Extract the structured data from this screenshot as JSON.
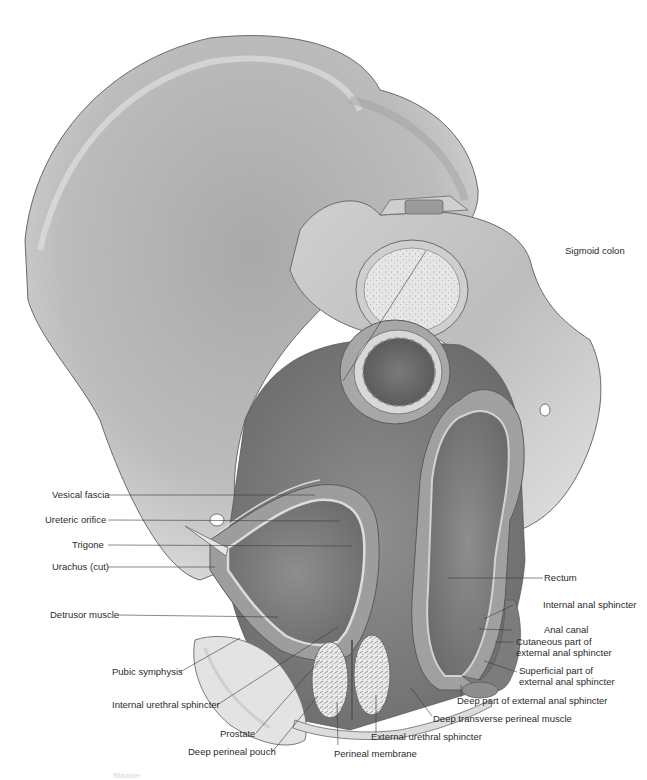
{
  "figure": {
    "colors": {
      "background": "#ffffff",
      "bone_light": "#dcdcdc",
      "bone_mid": "#b8b8b8",
      "soft_tissue": "#8a8a8a",
      "dark_tissue": "#5a5a5a",
      "wall_layer": "#9d9d9d",
      "leader_line": "#3a3a3a",
      "label_text": "#2b2b2b"
    }
  },
  "labels": {
    "sigmoid_colon": "Sigmoid colon",
    "vesical_fascia": "Vesical fascia",
    "ureteric_orifice": "Ureteric orifice",
    "trigone": "Trigone",
    "urachus_cut": "Urachus (cut)",
    "detrusor_muscle": "Detrusor muscle",
    "pubic_symphysis": "Pubic symphysis",
    "internal_urethral_sphincter": "Internal urethral sphincter",
    "prostate": "Prostate",
    "deep_perineal_pouch": "Deep perineal pouch",
    "perineal_membrane": "Perineal membrane",
    "external_urethral_sphincter": "External urethral sphincter",
    "deep_transverse_perineal_muscle": "Deep transverse perineal muscle",
    "deep_part_external_anal_sphincter": "Deep part of external anal sphincter",
    "superficial_part_line1": "Superficial part of",
    "superficial_part_line2": "external anal sphincter",
    "cutaneous_part_line1": "Cutaneous part of",
    "cutaneous_part_line2": "external anal sphincter",
    "anal_canal": "Anal canal",
    "internal_anal_sphincter": "Internal anal sphincter",
    "rectum": "Rectum"
  },
  "caption": {
    "faint_text": "Bladder"
  }
}
